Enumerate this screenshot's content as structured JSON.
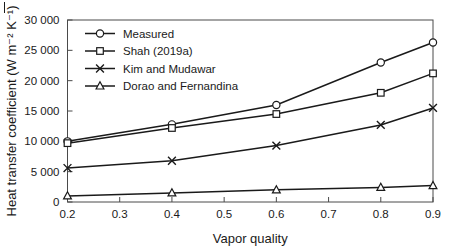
{
  "chart_data": {
    "type": "line",
    "title": "",
    "xlabel": "Vapor quality",
    "ylabel": "Heat transfer coefficient (W m⁻² K⁻¹)",
    "x": [
      0.2,
      0.4,
      0.6,
      0.8,
      0.9
    ],
    "xlim": [
      0.2,
      0.9
    ],
    "ylim": [
      0,
      30000
    ],
    "xticks": [
      "0.2",
      "0.3",
      "0.4",
      "0.5",
      "0.6",
      "0.7",
      "0.8",
      "0.9"
    ],
    "xtick_values": [
      0.2,
      0.3,
      0.4,
      0.5,
      0.6,
      0.7,
      0.8,
      0.9
    ],
    "yticks": [
      "0",
      "5 000",
      "10 000",
      "15 000",
      "20 000",
      "25 000",
      "30 000"
    ],
    "ytick_values": [
      0,
      5000,
      10000,
      15000,
      20000,
      25000,
      30000
    ],
    "grid": false,
    "legend_position": "upper-left-inside",
    "series": [
      {
        "name": "Measured",
        "marker": "circle",
        "values": [
          10000,
          12800,
          16000,
          23000,
          26300
        ]
      },
      {
        "name": "Shah (2019a)",
        "marker": "square",
        "values": [
          9700,
          12200,
          14500,
          18000,
          21200
        ]
      },
      {
        "name": "Kim and Mudawar",
        "marker": "x",
        "values": [
          5600,
          6800,
          9300,
          12700,
          15500
        ]
      },
      {
        "name": "Dorao and Fernandina",
        "marker": "triangle",
        "values": [
          1000,
          1500,
          2000,
          2400,
          2700
        ]
      }
    ]
  },
  "colors": {
    "line": "#1a1a1a",
    "axis": "#4a4a4a",
    "marker_fill": "#ffffff",
    "background": "#ffffff"
  }
}
